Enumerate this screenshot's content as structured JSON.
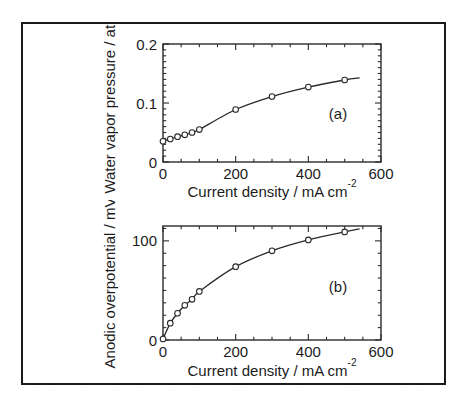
{
  "figure": {
    "border_color": "#1a1a1a",
    "background": "#ffffff",
    "marker_style": "open-circle",
    "line_color": "#2a2a2a"
  },
  "chart_data": [
    {
      "type": "scatter",
      "panel_tag": "(a)",
      "title": "",
      "xlabel": "Current density / mA cm",
      "xlabel_superscript": "-2",
      "ylabel": "Water vapor pressure / atm",
      "xlim": [
        0,
        600
      ],
      "ylim": [
        0,
        0.2
      ],
      "xticks": [
        0,
        200,
        400,
        600
      ],
      "xtick_labels": [
        "0",
        "200",
        "400",
        "600"
      ],
      "yticks": [
        0,
        0.1,
        0.2
      ],
      "ytick_labels": [
        "0",
        "0.1",
        "0.2"
      ],
      "x_minor_step": 50,
      "y_minor_step": 0.01,
      "grid": false,
      "legend": "none",
      "x": [
        0,
        20,
        40,
        60,
        80,
        100,
        200,
        300,
        400,
        500
      ],
      "y": [
        0.035,
        0.039,
        0.043,
        0.046,
        0.05,
        0.055,
        0.089,
        0.111,
        0.127,
        0.139
      ],
      "curve_extends_to_x": 540,
      "curve_extends_to_y": 0.1425
    },
    {
      "type": "scatter",
      "panel_tag": "(b)",
      "title": "",
      "xlabel": "Current density / mA cm",
      "xlabel_superscript": "-2",
      "ylabel": "Anodic overpotential / mV",
      "xlim": [
        0,
        600
      ],
      "ylim": [
        0,
        115
      ],
      "xticks": [
        0,
        200,
        400,
        600
      ],
      "xtick_labels": [
        "0",
        "200",
        "400",
        "600"
      ],
      "yticks": [
        0,
        100
      ],
      "ytick_labels": [
        "0",
        "100"
      ],
      "x_minor_step": 50,
      "y_minor_step": 12.5,
      "grid": false,
      "legend": "none",
      "x": [
        0,
        20,
        40,
        60,
        80,
        100,
        200,
        300,
        400,
        500
      ],
      "y": [
        1,
        17,
        27,
        35,
        41,
        49,
        74,
        90,
        101,
        109
      ],
      "curve_extends_to_x": 540,
      "curve_extends_to_y": 112
    }
  ]
}
